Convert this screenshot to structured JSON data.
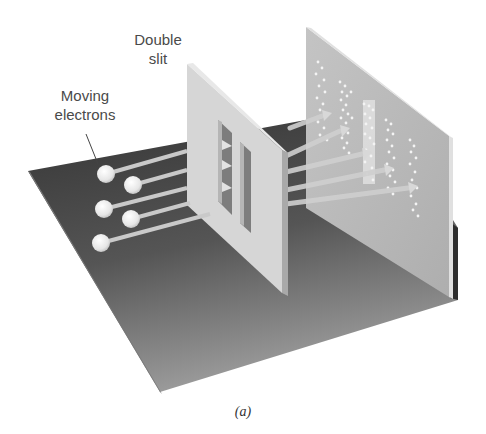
{
  "figure": {
    "labels": {
      "double_slit_line1": "Double",
      "double_slit_line2": "slit",
      "electrons_line1": "Moving",
      "electrons_line2": "electrons"
    },
    "caption": "(a)",
    "components": {
      "electron_count": 5,
      "slit_count": 2,
      "detector_pattern": "interference bands"
    },
    "colors": {
      "floor": "#3e3e3e",
      "floor_light": "#8a8a8a",
      "panel": "#d4d4d4",
      "screen": "#b8b8b8",
      "electron": "#f0f0f0",
      "beam": "#c8c8c8"
    }
  }
}
